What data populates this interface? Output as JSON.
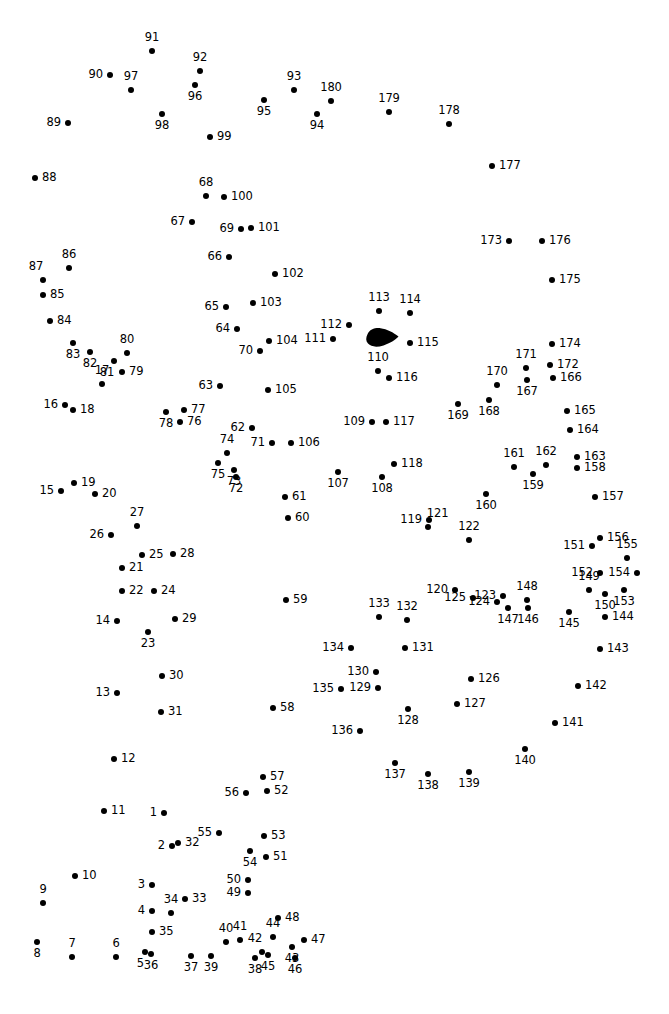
{
  "page": {
    "type": "connect-the-dots-puzzle",
    "width": 669,
    "height": 1014,
    "background_color": "#ffffff",
    "dot_color": "#000000",
    "label_color": "#000000",
    "dot_count": 180,
    "number_range": "1-180"
  },
  "filled_shape": {
    "name": "eye-marking",
    "color": "#000000",
    "x": 366,
    "y": 329,
    "width": 33,
    "height": 18
  },
  "dots": [
    {
      "n": "1",
      "x": 164,
      "y": 813,
      "lp": "l"
    },
    {
      "n": "2",
      "x": 172,
      "y": 846,
      "lp": "l"
    },
    {
      "n": "3",
      "x": 152,
      "y": 885,
      "lp": "l"
    },
    {
      "n": "4",
      "x": 152,
      "y": 911,
      "lp": "l"
    },
    {
      "n": "5",
      "x": 145,
      "y": 952,
      "lp": "bl"
    },
    {
      "n": "6",
      "x": 116,
      "y": 957,
      "lp": "t"
    },
    {
      "n": "7",
      "x": 72,
      "y": 957,
      "lp": "t"
    },
    {
      "n": "8",
      "x": 37,
      "y": 942,
      "lp": "b"
    },
    {
      "n": "9",
      "x": 43,
      "y": 903,
      "lp": "t"
    },
    {
      "n": "10",
      "x": 75,
      "y": 876,
      "lp": "r"
    },
    {
      "n": "11",
      "x": 104,
      "y": 811,
      "lp": "r"
    },
    {
      "n": "12",
      "x": 114,
      "y": 759,
      "lp": "r"
    },
    {
      "n": "13",
      "x": 117,
      "y": 693,
      "lp": "l"
    },
    {
      "n": "14",
      "x": 117,
      "y": 621,
      "lp": "l"
    },
    {
      "n": "15",
      "x": 61,
      "y": 491,
      "lp": "l"
    },
    {
      "n": "16",
      "x": 65,
      "y": 405,
      "lp": "l"
    },
    {
      "n": "17",
      "x": 102,
      "y": 384,
      "lp": "t"
    },
    {
      "n": "18",
      "x": 73,
      "y": 410,
      "lp": "r"
    },
    {
      "n": "19",
      "x": 74,
      "y": 483,
      "lp": "r"
    },
    {
      "n": "20",
      "x": 95,
      "y": 494,
      "lp": "r"
    },
    {
      "n": "21",
      "x": 122,
      "y": 568,
      "lp": "r"
    },
    {
      "n": "22",
      "x": 122,
      "y": 591,
      "lp": "r"
    },
    {
      "n": "23",
      "x": 148,
      "y": 632,
      "lp": "b"
    },
    {
      "n": "24",
      "x": 154,
      "y": 591,
      "lp": "r"
    },
    {
      "n": "25",
      "x": 142,
      "y": 555,
      "lp": "r"
    },
    {
      "n": "26",
      "x": 111,
      "y": 535,
      "lp": "l"
    },
    {
      "n": "27",
      "x": 137,
      "y": 526,
      "lp": "t"
    },
    {
      "n": "28",
      "x": 173,
      "y": 554,
      "lp": "r"
    },
    {
      "n": "29",
      "x": 175,
      "y": 619,
      "lp": "r"
    },
    {
      "n": "30",
      "x": 162,
      "y": 676,
      "lp": "r"
    },
    {
      "n": "31",
      "x": 161,
      "y": 712,
      "lp": "r"
    },
    {
      "n": "32",
      "x": 178,
      "y": 843,
      "lp": "r"
    },
    {
      "n": "33",
      "x": 185,
      "y": 899,
      "lp": "r"
    },
    {
      "n": "34",
      "x": 171,
      "y": 913,
      "lp": "t"
    },
    {
      "n": "35",
      "x": 152,
      "y": 932,
      "lp": "r"
    },
    {
      "n": "36",
      "x": 151,
      "y": 954,
      "lp": "b"
    },
    {
      "n": "37",
      "x": 191,
      "y": 956,
      "lp": "b"
    },
    {
      "n": "38",
      "x": 255,
      "y": 958,
      "lp": "b"
    },
    {
      "n": "39",
      "x": 211,
      "y": 956,
      "lp": "b"
    },
    {
      "n": "40",
      "x": 226,
      "y": 942,
      "lp": "t"
    },
    {
      "n": "41",
      "x": 240,
      "y": 940,
      "lp": "t"
    },
    {
      "n": "42",
      "x": 262,
      "y": 952,
      "lp": "tl"
    },
    {
      "n": "43",
      "x": 292,
      "y": 947,
      "lp": "b"
    },
    {
      "n": "44",
      "x": 273,
      "y": 937,
      "lp": "t"
    },
    {
      "n": "45",
      "x": 268,
      "y": 955,
      "lp": "b"
    },
    {
      "n": "46",
      "x": 295,
      "y": 958,
      "lp": "b"
    },
    {
      "n": "47",
      "x": 304,
      "y": 940,
      "lp": "r"
    },
    {
      "n": "48",
      "x": 278,
      "y": 918,
      "lp": "r"
    },
    {
      "n": "49",
      "x": 248,
      "y": 893,
      "lp": "l"
    },
    {
      "n": "50",
      "x": 248,
      "y": 880,
      "lp": "l"
    },
    {
      "n": "51",
      "x": 266,
      "y": 857,
      "lp": "r"
    },
    {
      "n": "52",
      "x": 267,
      "y": 791,
      "lp": "r"
    },
    {
      "n": "53",
      "x": 264,
      "y": 836,
      "lp": "r"
    },
    {
      "n": "54",
      "x": 250,
      "y": 851,
      "lp": "b"
    },
    {
      "n": "55",
      "x": 219,
      "y": 833,
      "lp": "l"
    },
    {
      "n": "56",
      "x": 246,
      "y": 793,
      "lp": "l"
    },
    {
      "n": "57",
      "x": 263,
      "y": 777,
      "lp": "r"
    },
    {
      "n": "58",
      "x": 273,
      "y": 708,
      "lp": "r"
    },
    {
      "n": "59",
      "x": 286,
      "y": 600,
      "lp": "r"
    },
    {
      "n": "60",
      "x": 288,
      "y": 518,
      "lp": "r"
    },
    {
      "n": "61",
      "x": 285,
      "y": 497,
      "lp": "r"
    },
    {
      "n": "62",
      "x": 252,
      "y": 428,
      "lp": "l"
    },
    {
      "n": "63",
      "x": 220,
      "y": 386,
      "lp": "l"
    },
    {
      "n": "64",
      "x": 237,
      "y": 329,
      "lp": "l"
    },
    {
      "n": "65",
      "x": 226,
      "y": 307,
      "lp": "l"
    },
    {
      "n": "66",
      "x": 229,
      "y": 257,
      "lp": "l"
    },
    {
      "n": "67",
      "x": 192,
      "y": 222,
      "lp": "l"
    },
    {
      "n": "68",
      "x": 206,
      "y": 196,
      "lp": "t"
    },
    {
      "n": "69",
      "x": 241,
      "y": 229,
      "lp": "l"
    },
    {
      "n": "70",
      "x": 260,
      "y": 351,
      "lp": "l"
    },
    {
      "n": "71",
      "x": 272,
      "y": 443,
      "lp": "l"
    },
    {
      "n": "72",
      "x": 236,
      "y": 477,
      "lp": "b"
    },
    {
      "n": "73",
      "x": 234,
      "y": 470,
      "lp": "b"
    },
    {
      "n": "74",
      "x": 227,
      "y": 453,
      "lp": "t"
    },
    {
      "n": "75",
      "x": 218,
      "y": 463,
      "lp": "b"
    },
    {
      "n": "76",
      "x": 180,
      "y": 422,
      "lp": "r"
    },
    {
      "n": "77",
      "x": 184,
      "y": 410,
      "lp": "r"
    },
    {
      "n": "78",
      "x": 166,
      "y": 412,
      "lp": "b"
    },
    {
      "n": "79",
      "x": 122,
      "y": 372,
      "lp": "r"
    },
    {
      "n": "80",
      "x": 127,
      "y": 353,
      "lp": "t"
    },
    {
      "n": "81",
      "x": 114,
      "y": 361,
      "lp": "bl"
    },
    {
      "n": "82",
      "x": 90,
      "y": 352,
      "lp": "b"
    },
    {
      "n": "83",
      "x": 73,
      "y": 343,
      "lp": "b"
    },
    {
      "n": "84",
      "x": 50,
      "y": 321,
      "lp": "r"
    },
    {
      "n": "85",
      "x": 43,
      "y": 295,
      "lp": "r"
    },
    {
      "n": "86",
      "x": 69,
      "y": 268,
      "lp": "t"
    },
    {
      "n": "87",
      "x": 43,
      "y": 280,
      "lp": "tl"
    },
    {
      "n": "88",
      "x": 35,
      "y": 178,
      "lp": "r"
    },
    {
      "n": "89",
      "x": 68,
      "y": 123,
      "lp": "l"
    },
    {
      "n": "90",
      "x": 110,
      "y": 75,
      "lp": "l"
    },
    {
      "n": "91",
      "x": 152,
      "y": 51,
      "lp": "t"
    },
    {
      "n": "92",
      "x": 200,
      "y": 71,
      "lp": "t"
    },
    {
      "n": "93",
      "x": 294,
      "y": 90,
      "lp": "t"
    },
    {
      "n": "94",
      "x": 317,
      "y": 114,
      "lp": "b"
    },
    {
      "n": "95",
      "x": 264,
      "y": 100,
      "lp": "b"
    },
    {
      "n": "96",
      "x": 195,
      "y": 85,
      "lp": "b"
    },
    {
      "n": "97",
      "x": 131,
      "y": 90,
      "lp": "t"
    },
    {
      "n": "98",
      "x": 162,
      "y": 114,
      "lp": "b"
    },
    {
      "n": "99",
      "x": 210,
      "y": 137,
      "lp": "r"
    },
    {
      "n": "100",
      "x": 224,
      "y": 197,
      "lp": "r"
    },
    {
      "n": "101",
      "x": 251,
      "y": 228,
      "lp": "r"
    },
    {
      "n": "102",
      "x": 275,
      "y": 274,
      "lp": "r"
    },
    {
      "n": "103",
      "x": 253,
      "y": 303,
      "lp": "r"
    },
    {
      "n": "104",
      "x": 269,
      "y": 341,
      "lp": "r"
    },
    {
      "n": "105",
      "x": 268,
      "y": 390,
      "lp": "r"
    },
    {
      "n": "106",
      "x": 291,
      "y": 443,
      "lp": "r"
    },
    {
      "n": "107",
      "x": 338,
      "y": 472,
      "lp": "b"
    },
    {
      "n": "108",
      "x": 382,
      "y": 477,
      "lp": "b"
    },
    {
      "n": "109",
      "x": 372,
      "y": 422,
      "lp": "l"
    },
    {
      "n": "110",
      "x": 378,
      "y": 371,
      "lp": "t"
    },
    {
      "n": "111",
      "x": 333,
      "y": 339,
      "lp": "l"
    },
    {
      "n": "112",
      "x": 349,
      "y": 325,
      "lp": "l"
    },
    {
      "n": "113",
      "x": 379,
      "y": 311,
      "lp": "t"
    },
    {
      "n": "114",
      "x": 410,
      "y": 313,
      "lp": "t"
    },
    {
      "n": "115",
      "x": 410,
      "y": 343,
      "lp": "r"
    },
    {
      "n": "116",
      "x": 389,
      "y": 378,
      "lp": "r"
    },
    {
      "n": "117",
      "x": 386,
      "y": 422,
      "lp": "r"
    },
    {
      "n": "118",
      "x": 394,
      "y": 464,
      "lp": "r"
    },
    {
      "n": "119",
      "x": 429,
      "y": 520,
      "lp": "l"
    },
    {
      "n": "120",
      "x": 455,
      "y": 590,
      "lp": "l"
    },
    {
      "n": "121",
      "x": 428,
      "y": 527,
      "lp": "tr"
    },
    {
      "n": "122",
      "x": 469,
      "y": 540,
      "lp": "t"
    },
    {
      "n": "123",
      "x": 503,
      "y": 596,
      "lp": "l"
    },
    {
      "n": "124",
      "x": 497,
      "y": 602,
      "lp": "l"
    },
    {
      "n": "125",
      "x": 473,
      "y": 598,
      "lp": "l"
    },
    {
      "n": "126",
      "x": 471,
      "y": 679,
      "lp": "r"
    },
    {
      "n": "127",
      "x": 457,
      "y": 704,
      "lp": "r"
    },
    {
      "n": "128",
      "x": 408,
      "y": 709,
      "lp": "b"
    },
    {
      "n": "129",
      "x": 378,
      "y": 688,
      "lp": "l"
    },
    {
      "n": "130",
      "x": 376,
      "y": 672,
      "lp": "l"
    },
    {
      "n": "131",
      "x": 405,
      "y": 648,
      "lp": "r"
    },
    {
      "n": "132",
      "x": 407,
      "y": 620,
      "lp": "t"
    },
    {
      "n": "133",
      "x": 379,
      "y": 617,
      "lp": "t"
    },
    {
      "n": "134",
      "x": 351,
      "y": 648,
      "lp": "l"
    },
    {
      "n": "135",
      "x": 341,
      "y": 689,
      "lp": "l"
    },
    {
      "n": "136",
      "x": 360,
      "y": 731,
      "lp": "l"
    },
    {
      "n": "137",
      "x": 395,
      "y": 763,
      "lp": "b"
    },
    {
      "n": "138",
      "x": 428,
      "y": 774,
      "lp": "b"
    },
    {
      "n": "139",
      "x": 469,
      "y": 772,
      "lp": "b"
    },
    {
      "n": "140",
      "x": 525,
      "y": 749,
      "lp": "b"
    },
    {
      "n": "141",
      "x": 555,
      "y": 723,
      "lp": "r"
    },
    {
      "n": "142",
      "x": 578,
      "y": 686,
      "lp": "r"
    },
    {
      "n": "143",
      "x": 600,
      "y": 649,
      "lp": "r"
    },
    {
      "n": "144",
      "x": 605,
      "y": 617,
      "lp": "r"
    },
    {
      "n": "145",
      "x": 569,
      "y": 612,
      "lp": "b"
    },
    {
      "n": "146",
      "x": 528,
      "y": 608,
      "lp": "b"
    },
    {
      "n": "147",
      "x": 508,
      "y": 608,
      "lp": "b"
    },
    {
      "n": "148",
      "x": 527,
      "y": 600,
      "lp": "t"
    },
    {
      "n": "149",
      "x": 589,
      "y": 590,
      "lp": "t"
    },
    {
      "n": "150",
      "x": 605,
      "y": 594,
      "lp": "b"
    },
    {
      "n": "151",
      "x": 592,
      "y": 546,
      "lp": "l"
    },
    {
      "n": "152",
      "x": 600,
      "y": 573,
      "lp": "l"
    },
    {
      "n": "153",
      "x": 624,
      "y": 590,
      "lp": "b"
    },
    {
      "n": "154",
      "x": 637,
      "y": 573,
      "lp": "l"
    },
    {
      "n": "155",
      "x": 627,
      "y": 558,
      "lp": "t"
    },
    {
      "n": "156",
      "x": 600,
      "y": 538,
      "lp": "r"
    },
    {
      "n": "157",
      "x": 595,
      "y": 497,
      "lp": "r"
    },
    {
      "n": "158",
      "x": 577,
      "y": 468,
      "lp": "r"
    },
    {
      "n": "159",
      "x": 533,
      "y": 474,
      "lp": "b"
    },
    {
      "n": "160",
      "x": 486,
      "y": 494,
      "lp": "b"
    },
    {
      "n": "161",
      "x": 514,
      "y": 467,
      "lp": "t"
    },
    {
      "n": "162",
      "x": 546,
      "y": 465,
      "lp": "t"
    },
    {
      "n": "163",
      "x": 577,
      "y": 457,
      "lp": "r"
    },
    {
      "n": "164",
      "x": 570,
      "y": 430,
      "lp": "r"
    },
    {
      "n": "165",
      "x": 567,
      "y": 411,
      "lp": "r"
    },
    {
      "n": "166",
      "x": 553,
      "y": 378,
      "lp": "r"
    },
    {
      "n": "167",
      "x": 527,
      "y": 380,
      "lp": "b"
    },
    {
      "n": "168",
      "x": 489,
      "y": 400,
      "lp": "b"
    },
    {
      "n": "169",
      "x": 458,
      "y": 404,
      "lp": "b"
    },
    {
      "n": "170",
      "x": 497,
      "y": 385,
      "lp": "t"
    },
    {
      "n": "171",
      "x": 526,
      "y": 368,
      "lp": "t"
    },
    {
      "n": "172",
      "x": 550,
      "y": 365,
      "lp": "r"
    },
    {
      "n": "173",
      "x": 509,
      "y": 241,
      "lp": "l"
    },
    {
      "n": "174",
      "x": 552,
      "y": 344,
      "lp": "r"
    },
    {
      "n": "175",
      "x": 552,
      "y": 280,
      "lp": "r"
    },
    {
      "n": "176",
      "x": 542,
      "y": 241,
      "lp": "r"
    },
    {
      "n": "177",
      "x": 492,
      "y": 166,
      "lp": "r"
    },
    {
      "n": "178",
      "x": 449,
      "y": 124,
      "lp": "t"
    },
    {
      "n": "179",
      "x": 389,
      "y": 112,
      "lp": "t"
    },
    {
      "n": "180",
      "x": 331,
      "y": 101,
      "lp": "t"
    }
  ]
}
